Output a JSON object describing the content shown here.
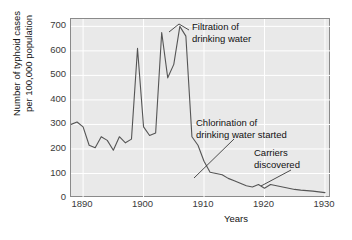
{
  "chart_data": {
    "type": "line",
    "title": "",
    "xlabel": "Years",
    "ylabel": "Number of typhoid cases per 100,000 population",
    "ylabel_lines": [
      "Number of typhoid cases",
      "per 100,000 population"
    ],
    "xlim": [
      1888,
      1931
    ],
    "ylim": [
      0,
      730
    ],
    "yticks": [
      0,
      100,
      200,
      300,
      400,
      500,
      600,
      700
    ],
    "ytick_labels": [
      "0",
      "100",
      "200",
      "300",
      "400",
      "500",
      "600",
      "700"
    ],
    "xticks": [
      1890,
      1900,
      1910,
      1920,
      1930
    ],
    "xtick_labels": [
      "1890",
      "1900",
      "1910",
      "1920",
      "1930"
    ],
    "grid": true,
    "legend": "none",
    "line_color": "#555555",
    "plot_background": "#e9e9e9",
    "gridline_color": "#ffffff",
    "x": [
      1888,
      1889,
      1890,
      1891,
      1892,
      1893,
      1894,
      1895,
      1896,
      1897,
      1898,
      1899,
      1900,
      1901,
      1902,
      1903,
      1904,
      1905,
      1906,
      1907,
      1908,
      1909,
      1910,
      1911,
      1912,
      1913,
      1914,
      1915,
      1916,
      1917,
      1918,
      1919,
      1920,
      1921,
      1922,
      1923,
      1924,
      1925,
      1926,
      1927,
      1928,
      1929,
      1930
    ],
    "values": [
      300,
      310,
      290,
      215,
      205,
      250,
      235,
      195,
      250,
      225,
      240,
      610,
      290,
      255,
      265,
      675,
      490,
      545,
      700,
      660,
      250,
      215,
      150,
      105,
      100,
      95,
      80,
      70,
      60,
      50,
      45,
      55,
      40,
      55,
      50,
      45,
      40,
      35,
      32,
      30,
      28,
      25,
      22
    ],
    "annotations": [
      {
        "text_lines": [
          "Filtration of",
          "drinking water"
        ],
        "points_to_year": 1906,
        "points_to_value": 700
      },
      {
        "text_lines": [
          "Chlorination of",
          "drinking water started"
        ],
        "points_to_year": 1911,
        "points_to_value": 105
      },
      {
        "text_lines": [
          "Carriers",
          "discovered"
        ],
        "points_to_year": 1922,
        "points_to_value": 50
      }
    ]
  },
  "axis": {
    "x_title": "Years",
    "y_title_line1": "Number of typhoid cases",
    "y_title_line2": "per 100,000 population"
  },
  "annotations": {
    "filtration": {
      "line1": "Filtration of",
      "line2": "drinking water"
    },
    "chlorination": {
      "line1": "Chlorination of",
      "line2": "drinking water started"
    },
    "carriers": {
      "line1": "Carriers",
      "line2": "discovered"
    }
  }
}
